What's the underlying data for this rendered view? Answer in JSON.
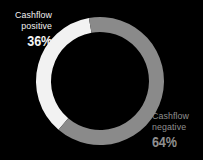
{
  "background_color": "#000000",
  "chart_data": {
    "type": "pie",
    "variant": "donut",
    "title": "",
    "subtitle": "",
    "xlabel": "",
    "ylabel": "",
    "legend_position": "inline-callout",
    "grid": false,
    "total": 100,
    "unit": "%",
    "hole_ratio": 0.77,
    "start_angle_deg": -10,
    "direction": "counterclockwise",
    "categories": [
      "Cashflow positive",
      "Cashflow negative"
    ],
    "values": [
      36,
      64
    ],
    "slices": [
      {
        "name": "Cashflow positive",
        "label_line1": "Cashflow",
        "label_line2": "positive",
        "value": 36,
        "value_label": "36%",
        "color": "#f2f2f2",
        "text_color": "#f2f2f2",
        "sweep_deg": 129.6
      },
      {
        "name": "Cashflow negative",
        "label_line1": "Cashflow",
        "label_line2": "negative",
        "value": 64,
        "value_label": "64%",
        "color": "#8a8a8a",
        "text_color": "#8f8f8f",
        "sweep_deg": 230.4
      }
    ]
  },
  "donut": {
    "center_x": 100,
    "center_y": 81,
    "outer_radius": 64,
    "ring_thickness": 15
  },
  "labels": {
    "positive": {
      "line1": "Cashflow",
      "line2": "positive",
      "percent": "36%"
    },
    "negative": {
      "line1": "Cashflow",
      "line2": "negative",
      "percent": "64%"
    }
  }
}
